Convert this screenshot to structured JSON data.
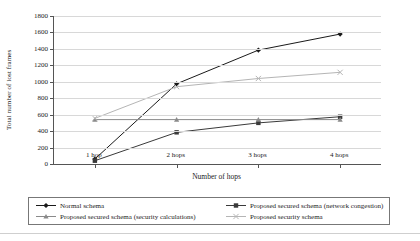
{
  "chart_data": {
    "type": "line",
    "title": "",
    "xlabel": "Number of hops",
    "ylabel": "Total number of lost frames",
    "categories": [
      "1 hop",
      "2 hops",
      "3 hops",
      "4 hops"
    ],
    "ylim": [
      0,
      1800
    ],
    "ytick_step": 200,
    "yticks": [
      1800,
      1600,
      1400,
      1200,
      1000,
      800,
      600,
      400,
      200,
      0
    ],
    "grid": true,
    "legend_position": "bottom",
    "series": [
      {
        "name": "Normal schema",
        "values": [
          60,
          975,
          1385,
          1580
        ],
        "color": "#1a1a1a",
        "marker": "diamond"
      },
      {
        "name": "Proposed secured schema (network congestion)",
        "values": [
          40,
          385,
          500,
          575
        ],
        "color": "#3a3a3a",
        "marker": "square"
      },
      {
        "name": "Proposed secured schema (security calculations)",
        "values": [
          540,
          540,
          540,
          540
        ],
        "color": "#8a8a8a",
        "marker": "triangle"
      },
      {
        "name": "Proposed security schema",
        "values": [
          555,
          940,
          1040,
          1115
        ],
        "color": "#b5b5b5",
        "marker": "x"
      }
    ]
  }
}
